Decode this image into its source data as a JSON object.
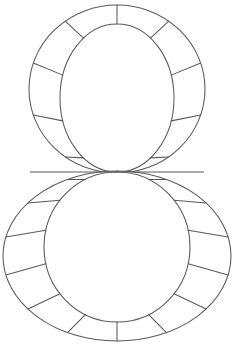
{
  "figure": {
    "name": "segmented-figure-eight-diagram",
    "background_color": "#ffffff",
    "stroke_color": "#59595b",
    "stroke_width": 1.05,
    "canvas": {
      "width": 234,
      "height": 351
    },
    "waist": {
      "x": 117,
      "y": 172,
      "line_x1": 30,
      "line_x2": 204
    },
    "rings": [
      {
        "id": "upper-ring",
        "label": "Upper ring",
        "segment_count": 10,
        "outer": {
          "cx": 117,
          "cy": 89,
          "rx": 88,
          "ry": 84
        },
        "inner": {
          "cx": 117,
          "cy": 98,
          "rx": 57,
          "ry": 74
        },
        "spoke_angles_deg": [
          -90,
          -54,
          -18,
          18,
          54,
          90,
          126,
          162,
          198,
          234
        ]
      },
      {
        "id": "lower-ring",
        "label": "Lower ring",
        "segment_count": 14,
        "outer": {
          "cx": 117,
          "cy": 256,
          "rx": 114,
          "ry": 85
        },
        "inner": {
          "cx": 117,
          "cy": 247,
          "rx": 73,
          "ry": 75
        },
        "spoke_angles_deg": [
          -90,
          -64.3,
          -38.6,
          -12.9,
          12.9,
          38.6,
          64.3,
          90,
          115.7,
          141.4,
          167.1,
          192.9,
          218.6,
          244.3
        ]
      }
    ]
  }
}
